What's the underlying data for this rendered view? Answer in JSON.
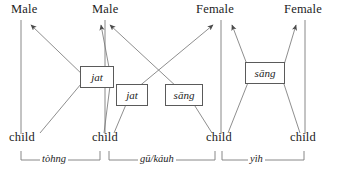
{
  "diagram": {
    "type": "kinship-relation-diagram",
    "stroke_color": "#5a5a5a",
    "text_color": "#1c1c1c",
    "background_color": "#ffffff"
  },
  "top_nodes": [
    {
      "id": "top-1",
      "label": "Male"
    },
    {
      "id": "top-2",
      "label": "Male"
    },
    {
      "id": "top-3",
      "label": "Female"
    },
    {
      "id": "top-4",
      "label": "Female"
    }
  ],
  "bottom_nodes": [
    {
      "id": "bottom-1",
      "label": "child"
    },
    {
      "id": "bottom-2",
      "label": "child"
    },
    {
      "id": "bottom-3",
      "label": "child"
    },
    {
      "id": "bottom-4",
      "label": "child"
    }
  ],
  "relation_boxes": [
    {
      "id": "box-1",
      "label": "jat"
    },
    {
      "id": "box-2",
      "label": "jat"
    },
    {
      "id": "box-3",
      "label": "sāng"
    },
    {
      "id": "box-4",
      "label": "sāng"
    }
  ],
  "brackets": [
    {
      "id": "bracket-1",
      "label": "tòhng"
    },
    {
      "id": "bracket-2",
      "label": "gū/káuh"
    },
    {
      "id": "bracket-3",
      "label": "yìh"
    }
  ]
}
